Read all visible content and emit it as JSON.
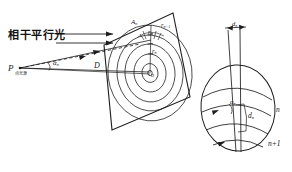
{
  "figure": {
    "stroke_color": "#1d1d1d",
    "background": "#ffffff"
  },
  "left_diagram": {
    "beam_label": "相干平行光",
    "source_point": {
      "symbol": "P",
      "caption": "点光源"
    },
    "angle_label": {
      "symbol": "α",
      "subscript": "n"
    },
    "distance_label": "D",
    "screen": {
      "name": "tilted-observation-plane",
      "center_label": "o",
      "ring_labels": [
        {
          "symbol": "A",
          "subscript": "n"
        },
        {
          "symbol": "r",
          "subscript": "n"
        },
        {
          "symbol": "r",
          "subscript": "n+1"
        },
        {
          "symbol": "r",
          "subscript": "n"
        }
      ],
      "ring_count": 5
    }
  },
  "right_diagram": {
    "name": "ring-spacing-detail",
    "spacing_top_label": {
      "symbol": "d",
      "subscript": "n"
    },
    "angle_label": {
      "symbol": "α",
      "subscript": "n"
    },
    "gap_label": {
      "symbol": "d",
      "subscript": "n"
    },
    "order_labels": [
      {
        "text": "n"
      },
      {
        "text": "n+1"
      }
    ]
  }
}
